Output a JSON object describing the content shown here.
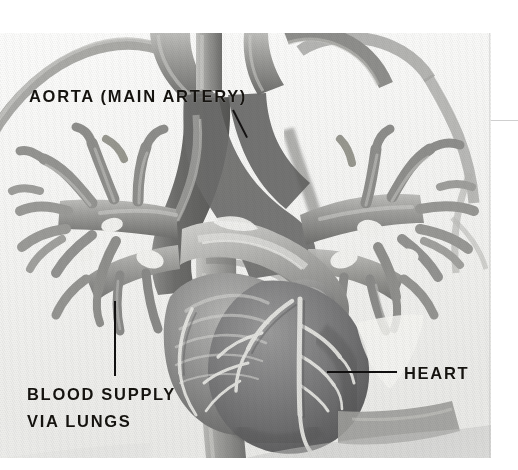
{
  "figure": {
    "kind": "anatomical-illustration",
    "style": "grayscale halftone scan"
  },
  "labels": {
    "aorta": "AORTA (MAIN ARTERY)",
    "blood_supply_line1": "BLOOD SUPPLY",
    "blood_supply_line2": "VIA LUNGS",
    "heart": "HEART"
  },
  "leaders": {
    "aorta": "diagonal-leader-line",
    "blood_supply": "vertical-leader-line",
    "heart": "horizontal-leader-line"
  },
  "colors": {
    "background": "#f4f4f2",
    "text": "#15130f",
    "leader": "#141212",
    "vessel_light": "#a9a9a6",
    "vessel_mid": "#8e8e8b",
    "vessel_dark": "#6f6f6d",
    "aorta_dark": "#6a6a68",
    "heart_muscle": "#79797a",
    "heart_shadow": "#5d5d5e",
    "coronary_highlight": "#e3e3df",
    "edge_rule": "#cfcfcf"
  },
  "structures": [
    {
      "name": "aortic-arch",
      "tone": "dark"
    },
    {
      "name": "brachiocephalic-trunk",
      "tone": "mid"
    },
    {
      "name": "left-common-carotid-artery",
      "tone": "mid"
    },
    {
      "name": "left-subclavian-artery",
      "tone": "mid"
    },
    {
      "name": "pulmonary-trunk",
      "tone": "light"
    },
    {
      "name": "left-pulmonary-artery-branches",
      "tone": "mid"
    },
    {
      "name": "right-pulmonary-artery-branches",
      "tone": "mid"
    },
    {
      "name": "left-ventricle",
      "tone": "dark"
    },
    {
      "name": "right-ventricle",
      "tone": "mid"
    },
    {
      "name": "left-atrial-appendage",
      "tone": "mid"
    },
    {
      "name": "coronary-arteries",
      "tone": "highlight"
    },
    {
      "name": "descending-aorta",
      "tone": "dark"
    },
    {
      "name": "inferior-vena-cava",
      "tone": "mid"
    }
  ]
}
